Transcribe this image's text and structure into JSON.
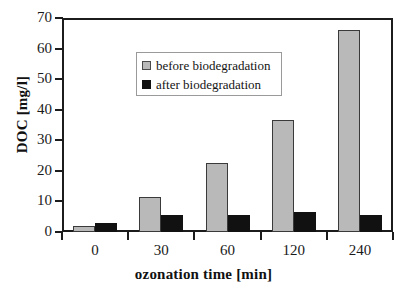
{
  "chart_data": {
    "type": "bar",
    "title": "",
    "xlabel": "ozonation time [min]",
    "ylabel": "DOC [mg/l]",
    "categories": [
      "0",
      "30",
      "60",
      "120",
      "240"
    ],
    "series": [
      {
        "name": "before biodegradation",
        "color": "#b9b9b9",
        "values": [
          2.0,
          11.5,
          22.5,
          36.5,
          66.0
        ]
      },
      {
        "name": "after biodegradation",
        "color": "#111111",
        "values": [
          3.0,
          5.5,
          5.5,
          6.5,
          5.5
        ]
      }
    ],
    "ylim": [
      0,
      70
    ],
    "yticks": [
      0,
      10,
      20,
      30,
      40,
      50,
      60,
      70
    ],
    "ytick_labels": [
      "0",
      "10",
      "20",
      "30",
      "40",
      "50",
      "60",
      "70"
    ],
    "grid": false,
    "legend_position": "top-left"
  },
  "legend": {
    "entries": [
      {
        "label": "before biodegradation"
      },
      {
        "label": "after biodegradation"
      }
    ]
  }
}
